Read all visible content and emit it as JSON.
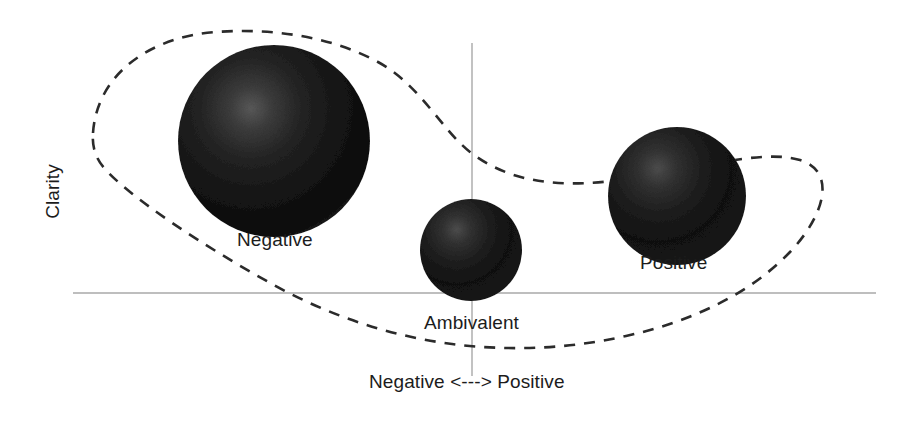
{
  "figure": {
    "background_color": "#ffffff",
    "axis_color": "#a8a8a8",
    "envelope_color": "#2b2b2b",
    "bubble_color": "#161616",
    "text_color": "#1c1c1c"
  },
  "axes": {
    "y_label": "Clarity",
    "x_label": "Negative <---> Positive",
    "horizontal": {
      "x1": 73,
      "y1": 293,
      "x2": 876,
      "y2": 293
    },
    "vertical": {
      "x1": 472,
      "y1": 43,
      "x2": 472,
      "y2": 376
    }
  },
  "chart_data": {
    "type": "scatter",
    "title": "",
    "xlabel": "Negative <---> Positive",
    "ylabel": "Clarity",
    "grid": false,
    "legend": "none",
    "axis_style": "origin-cross",
    "xlim": [
      -1,
      1
    ],
    "ylim": [
      -0.35,
      1
    ],
    "points": [
      {
        "label": "Negative",
        "cx": 274,
        "cy": 141,
        "r": 96,
        "size": "large",
        "x": -0.5,
        "y": 0.55,
        "label_x": 237,
        "label_y": 230
      },
      {
        "label": "Ambivalent",
        "cx": 471,
        "cy": 250,
        "r": 51,
        "size": "small",
        "x": 0.0,
        "y": 0.13,
        "label_x": 424,
        "label_y": 313
      },
      {
        "label": "Positive",
        "cx": 677,
        "cy": 196,
        "r": 69,
        "size": "medium",
        "x": 0.51,
        "y": 0.33,
        "label_x": 640,
        "label_y": 253
      }
    ],
    "annotations": [
      {
        "name": "envelope",
        "style": "dashed-closed-curve",
        "description": "dashed boomerang-shaped closed contour enclosing all three bubbles"
      }
    ]
  },
  "labels": {
    "negative": "Negative",
    "ambivalent": "Ambivalent",
    "positive": "Positive",
    "x_axis": "Negative <---> Positive",
    "y_axis": "Clarity"
  }
}
